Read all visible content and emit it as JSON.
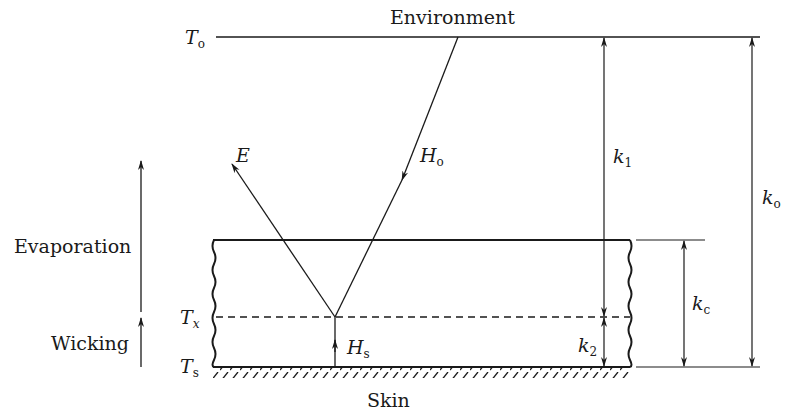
{
  "diagram": {
    "labels": {
      "environment": "Environment",
      "skin": "Skin",
      "evaporation": "Evaporation",
      "wicking": "Wicking"
    },
    "temperatures": {
      "To": {
        "symbol": "T",
        "sub": "o"
      },
      "Tx": {
        "symbol": "T",
        "sub": "x"
      },
      "Ts": {
        "symbol": "T",
        "sub": "s"
      }
    },
    "fluxes": {
      "E": {
        "symbol": "E"
      },
      "Ho": {
        "symbol": "H",
        "sub": "o"
      },
      "Hs": {
        "symbol": "H",
        "sub": "s"
      }
    },
    "conductances": {
      "k1": {
        "symbol": "k",
        "sub": "1"
      },
      "k2": {
        "symbol": "k",
        "sub": "2"
      },
      "kc": {
        "symbol": "k",
        "sub": "c"
      },
      "ko": {
        "symbol": "k",
        "sub": "o"
      }
    },
    "colors": {
      "line": "#1a1a1a",
      "background": "#ffffff"
    }
  }
}
